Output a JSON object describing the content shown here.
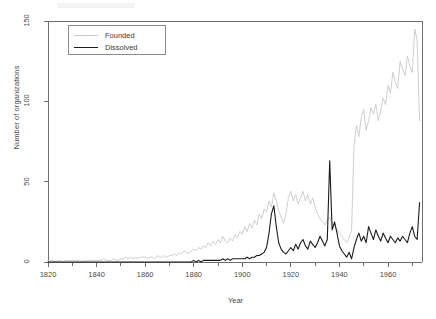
{
  "chart_data": {
    "type": "line",
    "title": "",
    "xlabel": "Year",
    "ylabel": "Number of organizations",
    "xlim": [
      1820,
      1974
    ],
    "ylim": [
      0,
      150
    ],
    "grid": false,
    "legend_position": "top-left",
    "xticks": [
      1820,
      1840,
      1860,
      1880,
      1900,
      1920,
      1940,
      1960
    ],
    "xtick_labels": [
      "1820",
      "1840",
      "1860",
      "1880",
      "1900",
      "1920",
      "1940",
      "1960"
    ],
    "xminorticks": [
      1830,
      1850,
      1870,
      1890,
      1910,
      1930,
      1950,
      1970
    ],
    "yticks": [
      0,
      50,
      100,
      150
    ],
    "ytick_labels": [
      "0",
      "50",
      "100",
      "150"
    ],
    "colors": {
      "founded": "#c9c9c9",
      "dissolved": "#1c1c1c",
      "axis": "#6e6e6e",
      "text": "#4a4a4a",
      "background": "#ffffff"
    },
    "x": [
      1820,
      1821,
      1822,
      1823,
      1824,
      1825,
      1826,
      1827,
      1828,
      1829,
      1830,
      1831,
      1832,
      1833,
      1834,
      1835,
      1836,
      1837,
      1838,
      1839,
      1840,
      1841,
      1842,
      1843,
      1844,
      1845,
      1846,
      1847,
      1848,
      1849,
      1850,
      1851,
      1852,
      1853,
      1854,
      1855,
      1856,
      1857,
      1858,
      1859,
      1860,
      1861,
      1862,
      1863,
      1864,
      1865,
      1866,
      1867,
      1868,
      1869,
      1870,
      1871,
      1872,
      1873,
      1874,
      1875,
      1876,
      1877,
      1878,
      1879,
      1880,
      1881,
      1882,
      1883,
      1884,
      1885,
      1886,
      1887,
      1888,
      1889,
      1890,
      1891,
      1892,
      1893,
      1894,
      1895,
      1896,
      1897,
      1898,
      1899,
      1900,
      1901,
      1902,
      1903,
      1904,
      1905,
      1906,
      1907,
      1908,
      1909,
      1910,
      1911,
      1912,
      1913,
      1914,
      1915,
      1916,
      1917,
      1918,
      1919,
      1920,
      1921,
      1922,
      1923,
      1924,
      1925,
      1926,
      1927,
      1928,
      1929,
      1930,
      1931,
      1932,
      1933,
      1934,
      1935,
      1936,
      1937,
      1938,
      1939,
      1940,
      1941,
      1942,
      1943,
      1944,
      1945,
      1946,
      1947,
      1948,
      1949,
      1950,
      1951,
      1952,
      1953,
      1954,
      1955,
      1956,
      1957,
      1958,
      1959,
      1960,
      1961,
      1962,
      1963,
      1964,
      1965,
      1966,
      1967,
      1968,
      1969,
      1970,
      1971,
      1972,
      1973
    ],
    "series": [
      {
        "name": "Founded",
        "color": "#c9c9c9",
        "values": [
          1,
          1,
          1,
          0,
          1,
          1,
          0,
          1,
          1,
          1,
          1,
          1,
          1,
          1,
          0,
          1,
          1,
          1,
          1,
          1,
          1,
          1,
          1,
          2,
          1,
          1,
          1,
          2,
          1,
          1,
          2,
          2,
          3,
          2,
          3,
          2,
          3,
          2,
          3,
          3,
          3,
          2,
          3,
          3,
          2,
          4,
          3,
          3,
          4,
          3,
          4,
          4,
          5,
          4,
          6,
          5,
          7,
          6,
          5,
          7,
          8,
          7,
          9,
          8,
          10,
          9,
          12,
          10,
          13,
          11,
          14,
          12,
          16,
          13,
          12,
          15,
          13,
          17,
          15,
          19,
          17,
          22,
          19,
          24,
          21,
          26,
          23,
          30,
          27,
          33,
          31,
          38,
          34,
          43,
          38,
          32,
          28,
          24,
          30,
          40,
          44,
          38,
          42,
          36,
          40,
          44,
          38,
          42,
          36,
          40,
          34,
          30,
          27,
          25,
          23,
          26,
          28,
          24,
          22,
          20,
          18,
          16,
          14,
          12,
          15,
          20,
          72,
          85,
          78,
          90,
          95,
          82,
          88,
          96,
          92,
          98,
          88,
          94,
          102,
          98,
          110,
          105,
          118,
          112,
          108,
          125,
          120,
          116,
          128,
          122,
          118,
          145,
          138,
          88
        ]
      },
      {
        "name": "Dissolved",
        "color": "#1c1c1c",
        "values": [
          0,
          0,
          0,
          0,
          0,
          0,
          0,
          0,
          0,
          0,
          0,
          0,
          0,
          0,
          0,
          0,
          0,
          0,
          0,
          0,
          0,
          0,
          0,
          0,
          0,
          0,
          0,
          0,
          0,
          0,
          0,
          0,
          0,
          0,
          0,
          0,
          0,
          0,
          0,
          0,
          0,
          0,
          0,
          0,
          0,
          0,
          0,
          0,
          0,
          0,
          0,
          0,
          0,
          0,
          0,
          0,
          0,
          0,
          0,
          0,
          1,
          0,
          1,
          0,
          1,
          1,
          1,
          1,
          1,
          1,
          1,
          1,
          2,
          1,
          2,
          1,
          2,
          2,
          2,
          2,
          2,
          2,
          3,
          2,
          3,
          3,
          4,
          4,
          5,
          6,
          9,
          18,
          30,
          35,
          22,
          12,
          8,
          6,
          5,
          7,
          9,
          7,
          11,
          8,
          12,
          14,
          10,
          8,
          13,
          11,
          9,
          12,
          16,
          13,
          10,
          14,
          63,
          20,
          25,
          18,
          10,
          7,
          5,
          3,
          6,
          2,
          9,
          14,
          18,
          13,
          16,
          12,
          22,
          18,
          14,
          20,
          16,
          13,
          18,
          15,
          12,
          16,
          14,
          12,
          15,
          13,
          16,
          14,
          12,
          18,
          22,
          16,
          14,
          37
        ]
      }
    ]
  },
  "legend": {
    "items": [
      {
        "label": "Founded"
      },
      {
        "label": "Dissolved"
      }
    ]
  },
  "axes": {
    "x_title": "Year",
    "y_title": "Number of organizations"
  }
}
